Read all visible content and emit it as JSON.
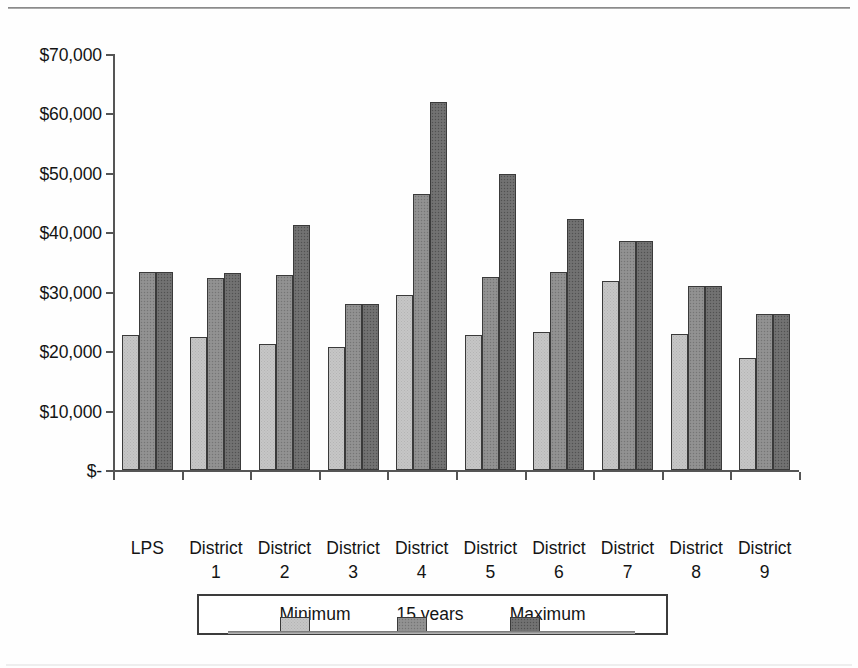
{
  "chart_data": {
    "type": "bar",
    "title": "",
    "xlabel": "School Districts",
    "ylabel": "",
    "ylim": [
      0,
      70000
    ],
    "ytick_step": 10000,
    "grid": false,
    "legend_position": "bottom",
    "categories": [
      "LPS",
      "District 1",
      "District 2",
      "District 3",
      "District 4",
      "District 5",
      "District 6",
      "District 7",
      "District 8",
      "District 9"
    ],
    "category_lines": [
      [
        "LPS",
        ""
      ],
      [
        "District",
        "1"
      ],
      [
        "District",
        "2"
      ],
      [
        "District",
        "3"
      ],
      [
        "District",
        "4"
      ],
      [
        "District",
        "5"
      ],
      [
        "District",
        "6"
      ],
      [
        "District",
        "7"
      ],
      [
        "District",
        "8"
      ],
      [
        "District",
        "9"
      ]
    ],
    "ytick_labels": [
      "$70,000",
      "$60,000",
      "$50,000",
      "$40,000",
      "$30,000",
      "$20,000",
      "$10,000",
      "$-"
    ],
    "ytick_values": [
      70000,
      60000,
      50000,
      40000,
      30000,
      20000,
      10000,
      0
    ],
    "series": [
      {
        "name": "Minimum",
        "color": "#c6c6c6",
        "values": [
          22800,
          22300,
          21200,
          20700,
          29500,
          22800,
          23200,
          31800,
          22900,
          18900
        ]
      },
      {
        "name": "15 years",
        "color": "#8e8e8e",
        "values": [
          33400,
          32300,
          32800,
          28000,
          46400,
          32400,
          33300,
          38600,
          31000,
          26200
        ]
      },
      {
        "name": "Maximum",
        "color": "#6e6e6e",
        "values": [
          33400,
          33100,
          41200,
          28000,
          62000,
          49800,
          42200,
          38600,
          31000,
          26200
        ]
      }
    ]
  },
  "legend": {
    "items": [
      {
        "label": "Minimum",
        "swatch": "light-gray-swatch"
      },
      {
        "label": "15 years",
        "swatch": "medium-gray-swatch"
      },
      {
        "label": "Maximum",
        "swatch": "dark-gray-swatch"
      }
    ]
  }
}
